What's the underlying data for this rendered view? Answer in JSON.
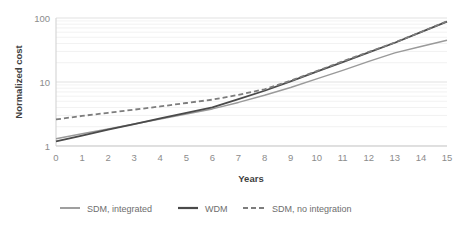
{
  "chart_data": {
    "type": "line",
    "title": "",
    "xlabel": "Years",
    "ylabel": "Normalized cost",
    "xlim": [
      0,
      15
    ],
    "ylim": [
      1,
      100
    ],
    "yscale": "log",
    "grid": true,
    "legend_position": "bottom",
    "xticks": [
      "0",
      "1",
      "2",
      "3",
      "4",
      "5",
      "6",
      "7",
      "8",
      "9",
      "10",
      "11",
      "12",
      "13",
      "14",
      "15"
    ],
    "yticks": [
      "1",
      "10",
      "100"
    ],
    "x": [
      0,
      1,
      2,
      3,
      4,
      5,
      6,
      7,
      8,
      9,
      10,
      11,
      12,
      13,
      14,
      15
    ],
    "series": [
      {
        "name": "SDM, integrated",
        "color": "#9a9a9a",
        "style": "solid",
        "width": 1.5,
        "values": [
          1.3,
          1.55,
          1.85,
          2.2,
          2.65,
          3.15,
          3.8,
          4.8,
          6.2,
          8.2,
          11.2,
          15.2,
          21.0,
          28.5,
          36.0,
          45.0
        ]
      },
      {
        "name": "WDM",
        "color": "#4a4a4a",
        "style": "solid",
        "width": 1.8,
        "values": [
          1.18,
          1.45,
          1.8,
          2.2,
          2.7,
          3.3,
          4.0,
          5.4,
          7.3,
          10.2,
          14.5,
          20.5,
          29.0,
          41.0,
          60.0,
          88.0
        ]
      },
      {
        "name": "SDM, no integration",
        "color": "#7d7d7d",
        "style": "dashed",
        "width": 1.8,
        "values": [
          2.6,
          2.95,
          3.3,
          3.7,
          4.15,
          4.7,
          5.3,
          6.3,
          7.7,
          10.5,
          14.8,
          21.0,
          29.5,
          41.5,
          60.5,
          89.0
        ]
      }
    ]
  },
  "legend": {
    "items": [
      {
        "label": "SDM, integrated"
      },
      {
        "label": "WDM"
      },
      {
        "label": "SDM, no integration"
      }
    ]
  }
}
